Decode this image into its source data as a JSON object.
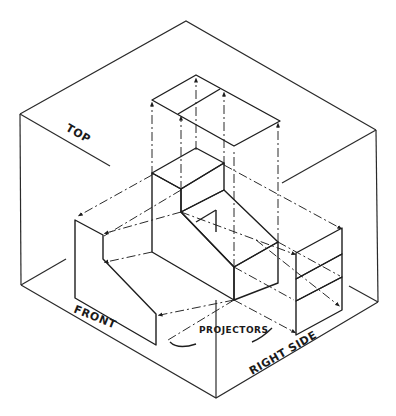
{
  "figure": {
    "labels": {
      "top": "TOP",
      "front": "FRONT",
      "right_side": "RIGHT SIDE",
      "projectors": "PROJECTORS"
    },
    "colors": {
      "line": "#1e1e1e",
      "face_light": "#d9d9d9",
      "face_mid": "#bdbdbd",
      "face_dark": "#a6a6a6",
      "background": "#ffffff"
    }
  }
}
